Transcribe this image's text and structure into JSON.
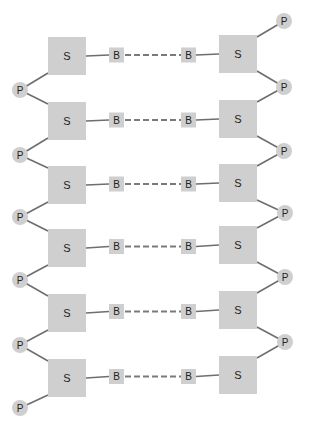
{
  "diagram": {
    "type": "dna-double-strand-schematic",
    "labels": {
      "sugar": "S",
      "base": "B",
      "phosphate": "P"
    },
    "colors": {
      "node_fill": "#cfcfcf",
      "line": "#6e6e6e",
      "text": "#222222"
    },
    "rows": [
      {
        "left_sugar": "S",
        "left_base": "B",
        "right_base": "B",
        "right_sugar": "S"
      },
      {
        "left_sugar": "S",
        "left_base": "B",
        "right_base": "B",
        "right_sugar": "S"
      },
      {
        "left_sugar": "S",
        "left_base": "B",
        "right_base": "B",
        "right_sugar": "S"
      },
      {
        "left_sugar": "S",
        "left_base": "B",
        "right_base": "B",
        "right_sugar": "S"
      },
      {
        "left_sugar": "S",
        "left_base": "B",
        "right_base": "B",
        "right_sugar": "S"
      },
      {
        "left_sugar": "S",
        "left_base": "B",
        "right_base": "B",
        "right_sugar": "S"
      }
    ],
    "left_phosphates": [
      "P",
      "P",
      "P",
      "P",
      "P",
      "P"
    ],
    "right_phosphates": [
      "P",
      "P",
      "P",
      "P",
      "P",
      "P"
    ]
  }
}
